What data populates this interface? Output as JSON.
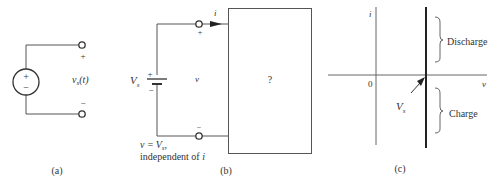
{
  "panel_a": {
    "caption": "(a)",
    "source_plus": "+",
    "source_minus": "−",
    "terminal_plus": "+",
    "terminal_minus": "−",
    "voltage_label_main": "v",
    "voltage_label_sub": "s",
    "voltage_label_arg": "(t)"
  },
  "panel_b": {
    "caption": "(b)",
    "current_label": "i",
    "terminal_plus": "+",
    "terminal_minus": "−",
    "battery_plus": "+",
    "battery_minus": "−",
    "source_label_main": "V",
    "source_label_sub": "s",
    "voltage_label": "v",
    "box_label": "?",
    "note_line1_prefix": "v =",
    "note_line1_var": "V",
    "note_line1_sub": "s",
    "note_line1_suffix": ",",
    "note_line2": "independent of ",
    "note_line2_var": "i"
  },
  "panel_c": {
    "caption": "(c)",
    "y_axis_label": "i",
    "x_axis_label": "v",
    "origin_label": "0",
    "discharge_label": "Discharge",
    "charge_label": "Charge",
    "vs_label_main": "V",
    "vs_label_sub": "s"
  },
  "colors": {
    "line": "#555555",
    "thick_line": "#222222",
    "text": "#333333"
  }
}
